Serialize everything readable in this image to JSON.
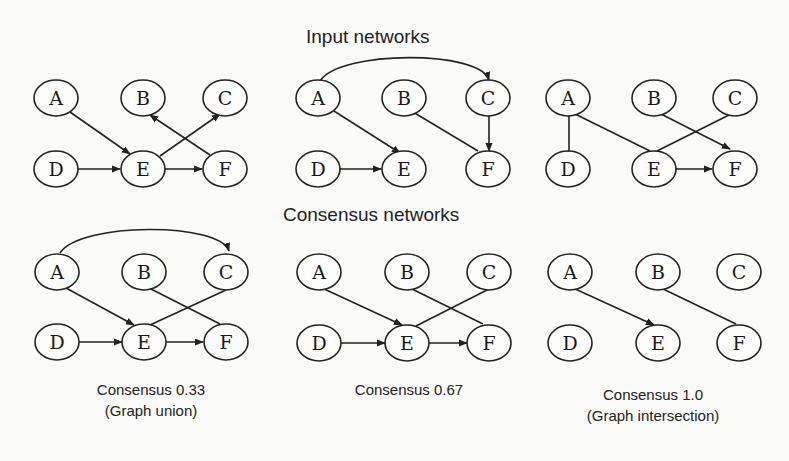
{
  "titles": {
    "input": "Input networks",
    "consensus": "Consensus networks"
  },
  "captions": {
    "c033_line1": "Consensus 0.33",
    "c033_line2": "(Graph union)",
    "c067_line1": "Consensus 0.67",
    "c100_line1": "Consensus 1.0",
    "c100_line2": "(Graph intersection)"
  },
  "node_labels": [
    "A",
    "B",
    "C",
    "D",
    "E",
    "F"
  ],
  "networks": [
    {
      "name": "input-network-1",
      "edges": [
        {
          "from": "A",
          "to": "E",
          "directed": true
        },
        {
          "from": "D",
          "to": "E",
          "directed": true
        },
        {
          "from": "E",
          "to": "F",
          "directed": true
        },
        {
          "from": "E",
          "to": "C",
          "directed": true
        },
        {
          "from": "F",
          "to": "B",
          "directed": true
        }
      ]
    },
    {
      "name": "input-network-2",
      "edges": [
        {
          "from": "A",
          "to": "C",
          "directed": true,
          "curved": true
        },
        {
          "from": "A",
          "to": "E",
          "directed": true
        },
        {
          "from": "D",
          "to": "E",
          "directed": true
        },
        {
          "from": "B",
          "to": "F",
          "directed": false
        },
        {
          "from": "C",
          "to": "F",
          "directed": true
        }
      ]
    },
    {
      "name": "input-network-3",
      "edges": [
        {
          "from": "A",
          "to": "D",
          "directed": false
        },
        {
          "from": "A",
          "to": "E",
          "directed": false
        },
        {
          "from": "B",
          "to": "F",
          "directed": true
        },
        {
          "from": "C",
          "to": "E",
          "directed": false
        },
        {
          "from": "E",
          "to": "F",
          "directed": true
        }
      ]
    },
    {
      "name": "consensus-0.33",
      "edges": [
        {
          "from": "A",
          "to": "C",
          "directed": true,
          "curved": true
        },
        {
          "from": "A",
          "to": "E",
          "directed": true
        },
        {
          "from": "B",
          "to": "F",
          "directed": false
        },
        {
          "from": "C",
          "to": "E",
          "directed": false
        },
        {
          "from": "D",
          "to": "E",
          "directed": true
        },
        {
          "from": "E",
          "to": "F",
          "directed": true
        }
      ]
    },
    {
      "name": "consensus-0.67",
      "edges": [
        {
          "from": "A",
          "to": "E",
          "directed": true
        },
        {
          "from": "B",
          "to": "F",
          "directed": false
        },
        {
          "from": "C",
          "to": "E",
          "directed": false
        },
        {
          "from": "D",
          "to": "E",
          "directed": true
        },
        {
          "from": "E",
          "to": "F",
          "directed": true
        }
      ]
    },
    {
      "name": "consensus-1.0",
      "edges": [
        {
          "from": "A",
          "to": "E",
          "directed": true
        },
        {
          "from": "B",
          "to": "F",
          "directed": false
        }
      ]
    }
  ]
}
